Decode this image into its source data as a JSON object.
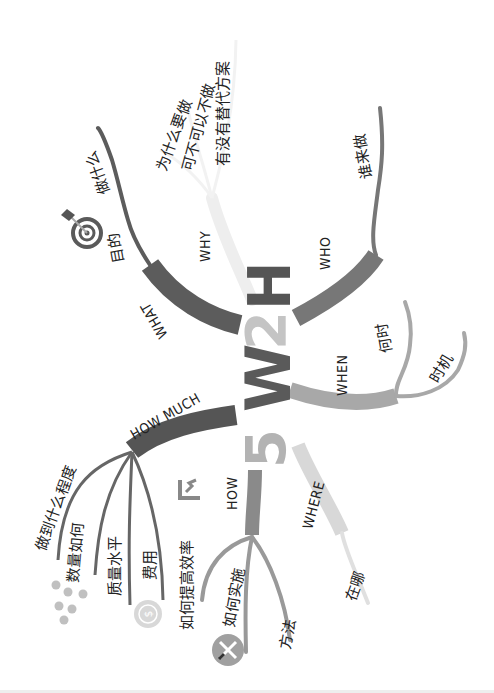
{
  "title": {
    "five": "5",
    "w": "W",
    "two": "2",
    "h": "H",
    "colors": {
      "five": "#b3b3b3",
      "w": "#5a5a5a",
      "two": "#c4c4c4",
      "h": "#555555"
    }
  },
  "branches": [
    {
      "id": "what",
      "label": "WHAT",
      "color": "#5c5c5c",
      "children": [
        "目的",
        "做什么"
      ],
      "icon": "target-icon"
    },
    {
      "id": "why",
      "label": "WHY",
      "color": "#efefef",
      "children": [
        "为什么要做",
        "可不可以不做",
        "有没有替代方案"
      ]
    },
    {
      "id": "who",
      "label": "WHO",
      "color": "#777777",
      "children": [
        "谁来做"
      ]
    },
    {
      "id": "when",
      "label": "WHEN",
      "color": "#a8a8a8",
      "children": [
        "何时",
        "时机"
      ]
    },
    {
      "id": "where",
      "label": "WHERE",
      "color": "#d6d6d6",
      "children": [
        "在哪"
      ]
    },
    {
      "id": "how",
      "label": "HOW",
      "color": "#8a8a8a",
      "children": [
        "如何提高效率",
        "如何实施",
        "方法"
      ],
      "icons": [
        "efficiency-icon",
        "tools-icon"
      ]
    },
    {
      "id": "how_much",
      "label": "HOW MUCH",
      "color": "#555555",
      "children": [
        "做到什么程度",
        "数量如何",
        "质量水平",
        "费用"
      ],
      "icons": [
        "dots-icon",
        "dollar-coin-icon"
      ]
    }
  ],
  "dollar_symbol": "$",
  "texture_glyphs": "HHHHHHHHHH"
}
